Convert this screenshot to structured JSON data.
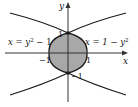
{
  "diagram": {
    "type": "region-between-curves",
    "axes": {
      "x_label": "x",
      "y_label": "y"
    },
    "curves": [
      {
        "name": "left-parabola",
        "equation": "x = y² − 1",
        "label_left": "x = y",
        "label_exp": "2",
        "label_tail": " − 1"
      },
      {
        "name": "right-parabola",
        "equation": "x = 1 − y²",
        "label_left": "x = 1 − y",
        "label_exp": "2"
      }
    ],
    "tick_labels": {
      "y_pos": "1",
      "y_neg": "−1",
      "x_pos": "1",
      "x_neg": "−1"
    },
    "colors": {
      "shade": "#a8a8a8",
      "stroke": "#1a1a1a",
      "axis": "#333333",
      "background": "#ffffff"
    }
  }
}
